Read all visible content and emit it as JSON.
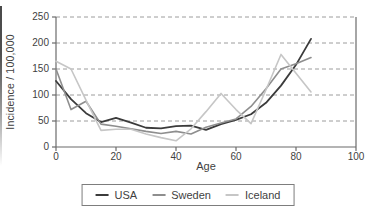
{
  "figure": {
    "background": "#ffffff",
    "text_color": "#3f3f3f",
    "axis_color": "#6b6b6b",
    "gridline_color": "#9c9c9c"
  },
  "chart_data": {
    "type": "line",
    "title": "",
    "xlabel": "Age",
    "ylabel": "Incidence / 100,000",
    "xlim": [
      0,
      100
    ],
    "ylim": [
      0,
      250
    ],
    "xticks": [
      0,
      20,
      40,
      60,
      80,
      100
    ],
    "yticks": [
      0,
      50,
      100,
      150,
      200,
      250
    ],
    "grid": "horizontal dashed gridlines at 50, 100, 150, 200, 250",
    "legend_position": "bottom-center",
    "x": [
      0,
      5,
      10,
      15,
      20,
      25,
      30,
      35,
      40,
      45,
      50,
      55,
      60,
      65,
      70,
      75,
      80,
      85
    ],
    "series": [
      {
        "name": "USA",
        "color": "#3b3b3b",
        "width": 1.8,
        "values": [
          127,
          92,
          65,
          48,
          56,
          47,
          37,
          36,
          40,
          41,
          33,
          44,
          52,
          63,
          85,
          118,
          158,
          208
        ]
      },
      {
        "name": "Sweden",
        "color": "#8e8e8e",
        "width": 1.6,
        "values": [
          150,
          72,
          88,
          44,
          40,
          35,
          30,
          26,
          30,
          25,
          38,
          46,
          54,
          78,
          112,
          150,
          160,
          172
        ]
      },
      {
        "name": "Iceland",
        "color": "#c6c6c6",
        "width": 1.6,
        "values": [
          165,
          150,
          90,
          32,
          34,
          34,
          25,
          18,
          12,
          35,
          68,
          103,
          72,
          45,
          110,
          178,
          142,
          106
        ]
      }
    ]
  }
}
